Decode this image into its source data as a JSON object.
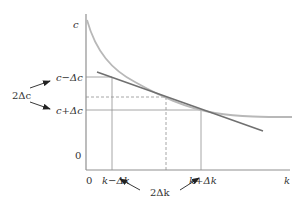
{
  "diagram": {
    "axes": {
      "y_label": "c",
      "x_label": "k",
      "y_origin": "0",
      "x_origin": "0"
    },
    "y_marks": {
      "upper": "c−Δc",
      "lower": "c+Δc",
      "span": "2Δc"
    },
    "x_marks": {
      "left": "k−Δk",
      "right": "k+Δk",
      "span": "2Δk"
    },
    "colors": {
      "curve": "#b8b8b8",
      "tangent": "#707070",
      "axes": "#909090",
      "guides": "#909090",
      "arrows": "#222222"
    }
  }
}
